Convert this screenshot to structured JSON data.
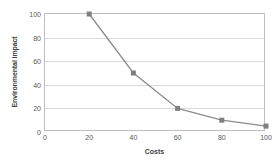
{
  "chart_data": {
    "type": "line",
    "title": "",
    "xlabel": "Costs",
    "ylabel": "Environmental impact",
    "x": [
      20,
      40,
      60,
      80,
      100
    ],
    "values": [
      100,
      50,
      20,
      10,
      5
    ],
    "series": [
      {
        "name": "",
        "x": [
          20,
          40,
          60,
          80,
          100
        ],
        "values": [
          100,
          50,
          20,
          10,
          5
        ]
      }
    ],
    "xlim": [
      0,
      100
    ],
    "ylim": [
      0,
      100
    ],
    "xticks": [
      "0",
      "20",
      "40",
      "60",
      "80",
      "100"
    ],
    "yticks": [
      "0",
      "20",
      "40",
      "60",
      "80",
      "100"
    ],
    "xtick_values": [
      0,
      20,
      40,
      60,
      80,
      100
    ],
    "ytick_values": [
      0,
      20,
      40,
      60,
      80,
      100
    ],
    "gridlines": {
      "horizontal": [
        20,
        40,
        60,
        80
      ],
      "vertical": []
    },
    "legend": "none",
    "marker": "square",
    "colors": {
      "line": "#8c8c8c",
      "marker": "#808080",
      "grid": "#d9d9d9",
      "frame": "#bfbfbf",
      "tick_label": "#595959",
      "axis_title": "#404040",
      "background": "#ffffff"
    }
  }
}
